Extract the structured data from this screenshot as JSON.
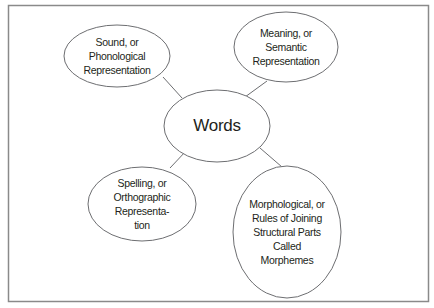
{
  "diagram": {
    "center": {
      "label": [
        "Words"
      ]
    },
    "nodes": [
      {
        "id": "sound",
        "label": [
          "Sound, or",
          "Phonological",
          "Representation"
        ]
      },
      {
        "id": "meaning",
        "label": [
          "Meaning, or",
          "Semantic",
          "Representation"
        ]
      },
      {
        "id": "spelling",
        "label": [
          "Spelling, or",
          "Orthographic",
          "Representa-",
          "tion"
        ]
      },
      {
        "id": "morphological",
        "label": [
          "Morphological, or",
          "Rules of Joining",
          "Structural Parts",
          "Called",
          "Morphemes"
        ]
      }
    ],
    "colors": {
      "stroke": "#6d6e71",
      "frame": "#8a8a8a",
      "text": "#231f20",
      "background": "#ffffff"
    }
  }
}
